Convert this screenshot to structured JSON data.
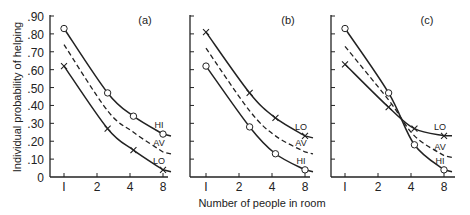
{
  "chart_data": [
    {
      "type": "line",
      "panel": "(a)",
      "title": "(a)",
      "xlabel": "Number of people in room",
      "ylabel": "Individual probability of helping",
      "x_ticks": [
        1,
        2,
        4,
        8
      ],
      "y_ticks": [
        0,
        0.1,
        0.2,
        0.3,
        0.4,
        0.5,
        0.6,
        0.7,
        0.8,
        0.9
      ],
      "y_tick_labels": [
        "0",
        ".10",
        ".20",
        ".30",
        ".40",
        ".50",
        ".60",
        ".70",
        ".80",
        ".90"
      ],
      "ylim": [
        0,
        0.9
      ],
      "series": [
        {
          "name": "HI",
          "marker": "circle",
          "style": "solid",
          "x": [
            1,
            2.5,
            4.3,
            8
          ],
          "values": [
            0.83,
            0.47,
            0.34,
            0.24
          ]
        },
        {
          "name": "AV",
          "marker": "none",
          "style": "dashed",
          "x": [
            1,
            2.5,
            4.3,
            8
          ],
          "values": [
            0.74,
            0.37,
            0.25,
            0.14
          ]
        },
        {
          "name": "LO",
          "marker": "cross",
          "style": "solid",
          "x": [
            1,
            2.5,
            4.3,
            8
          ],
          "values": [
            0.62,
            0.27,
            0.15,
            0.04
          ]
        }
      ]
    },
    {
      "type": "line",
      "panel": "(b)",
      "title": "(b)",
      "xlabel": "Number of people in room",
      "x_ticks": [
        1,
        2,
        4,
        8
      ],
      "ylim": [
        0,
        0.9
      ],
      "series": [
        {
          "name": "LO",
          "marker": "cross",
          "style": "solid",
          "x": [
            1,
            2.5,
            4.3,
            8
          ],
          "values": [
            0.81,
            0.47,
            0.33,
            0.23
          ]
        },
        {
          "name": "AV",
          "marker": "none",
          "style": "dashed",
          "x": [
            1,
            2.5,
            4.3,
            8
          ],
          "values": [
            0.72,
            0.37,
            0.23,
            0.14
          ]
        },
        {
          "name": "HI",
          "marker": "circle",
          "style": "solid",
          "x": [
            1,
            2.5,
            4.3,
            8
          ],
          "values": [
            0.62,
            0.28,
            0.13,
            0.04
          ]
        }
      ]
    },
    {
      "type": "line",
      "panel": "(c)",
      "title": "(c)",
      "xlabel": "Number of people in room",
      "x_ticks": [
        1,
        2,
        4,
        8
      ],
      "ylim": [
        0,
        0.9
      ],
      "series": [
        {
          "name": "LO",
          "marker": "cross",
          "style": "solid",
          "x": [
            1,
            2.5,
            4.3,
            8
          ],
          "values": [
            0.63,
            0.39,
            0.27,
            0.23
          ]
        },
        {
          "name": "AV",
          "marker": "none",
          "style": "dashed",
          "x": [
            1,
            2.5,
            4.3,
            8
          ],
          "values": [
            0.73,
            0.43,
            0.23,
            0.12
          ]
        },
        {
          "name": "HI",
          "marker": "circle",
          "style": "solid",
          "x": [
            1,
            2.5,
            4.3,
            8
          ],
          "values": [
            0.83,
            0.47,
            0.18,
            0.04
          ]
        }
      ]
    }
  ],
  "labels": {
    "ylabel": "Individual probability of helping",
    "xlabel": "Number of people in room",
    "panel_a": "(a)",
    "panel_b": "(b)",
    "panel_c": "(c)",
    "hi": "HI",
    "av": "AV",
    "lo": "LO"
  }
}
